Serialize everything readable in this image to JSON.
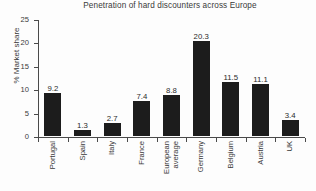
{
  "chart_data": {
    "type": "bar",
    "title": "Penetration of hard discounters across Europe",
    "xlabel": "",
    "ylabel": "% Market share",
    "ylim": [
      0,
      25
    ],
    "yticks": [
      0,
      5,
      10,
      15,
      20,
      25
    ],
    "grid": false,
    "legend": false,
    "bar_color": "#1c1c1c",
    "axis_color": "#4a4a4a",
    "value_labels": true,
    "categories": [
      "Portugal",
      "Spain",
      "Italy",
      "France",
      "European average",
      "Germany",
      "Belgium",
      "Austria",
      "UK"
    ],
    "values": [
      9.2,
      1.3,
      2.7,
      7.4,
      8.8,
      20.3,
      11.5,
      11.1,
      3.4
    ],
    "value_label_text": [
      "9.2",
      "1.3",
      "2.7",
      "7.4",
      "8.8",
      "20.3",
      "11.5",
      "11.1",
      "3.4"
    ],
    "category_lines": [
      [
        "Portugal"
      ],
      [
        "Spain"
      ],
      [
        "Italy"
      ],
      [
        "France"
      ],
      [
        "European",
        "average"
      ],
      [
        "Germany"
      ],
      [
        "Belgium"
      ],
      [
        "Austria"
      ],
      [
        "UK"
      ]
    ],
    "ytick_labels": [
      "0",
      "5",
      "10",
      "15",
      "20",
      "25"
    ]
  }
}
